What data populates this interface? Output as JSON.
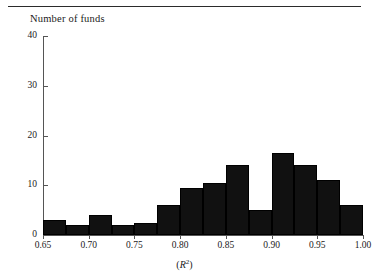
{
  "figure": {
    "title": "Number of funds",
    "xlabel_prefix": "(",
    "xlabel_symbol": "R",
    "xlabel_exponent": "2",
    "xlabel_suffix": ")",
    "xlabel_plain": "(R2)",
    "rule": "top-rule",
    "bar_color": "#111111",
    "axis_color": "#555555"
  },
  "chart_data": {
    "type": "bar",
    "title": "Number of funds",
    "xlabel": "(R2)",
    "ylabel": "Number of funds",
    "xlim": [
      0.65,
      1.0
    ],
    "ylim": [
      0,
      40
    ],
    "bin_width": 0.025,
    "grid": false,
    "legend": null,
    "xticks": [
      0.65,
      0.7,
      0.75,
      0.8,
      0.85,
      0.9,
      0.95,
      1.0
    ],
    "xtick_labels": [
      "0.65",
      "0.70",
      "0.75",
      "0.80",
      "0.85",
      "0.90",
      "0.95",
      "1.00"
    ],
    "yticks": [
      0,
      10,
      20,
      30,
      40
    ],
    "ytick_labels": [
      "0",
      "10",
      "20",
      "30",
      "40"
    ],
    "bin_edges": [
      0.65,
      0.675,
      0.7,
      0.725,
      0.75,
      0.775,
      0.8,
      0.825,
      0.85,
      0.875,
      0.9,
      0.925,
      0.95,
      0.975,
      1.0
    ],
    "categories": [
      "0.650-0.675",
      "0.675-0.700",
      "0.700-0.725",
      "0.725-0.750",
      "0.750-0.775",
      "0.775-0.800",
      "0.800-0.825",
      "0.825-0.850",
      "0.850-0.875",
      "0.875-0.900",
      "0.900-0.925",
      "0.925-0.950",
      "0.950-0.975",
      "0.975-1.000"
    ],
    "values": [
      3,
      2,
      4,
      2,
      2.5,
      6,
      9.5,
      10.5,
      14,
      5,
      16.5,
      14,
      11,
      6
    ]
  }
}
